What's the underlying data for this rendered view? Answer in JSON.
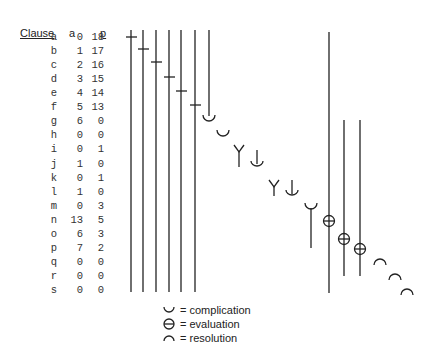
{
  "table": {
    "headers": {
      "clause": "Clause",
      "a": "a",
      "p": "p"
    },
    "rows": [
      {
        "clause": "a",
        "a": "0",
        "p": "18"
      },
      {
        "clause": "b",
        "a": "1",
        "p": "17"
      },
      {
        "clause": "c",
        "a": "2",
        "p": "16"
      },
      {
        "clause": "d",
        "a": "3",
        "p": "15"
      },
      {
        "clause": "e",
        "a": "4",
        "p": "14"
      },
      {
        "clause": "f",
        "a": "5",
        "p": "13"
      },
      {
        "clause": "g",
        "a": "6",
        "p": "0"
      },
      {
        "clause": "h",
        "a": "0",
        "p": "0"
      },
      {
        "clause": "i",
        "a": "0",
        "p": "1"
      },
      {
        "clause": "j",
        "a": "1",
        "p": "0"
      },
      {
        "clause": "k",
        "a": "0",
        "p": "1"
      },
      {
        "clause": "l",
        "a": "1",
        "p": "0"
      },
      {
        "clause": "m",
        "a": "0",
        "p": "3"
      },
      {
        "clause": "n",
        "a": "13",
        "p": "5"
      },
      {
        "clause": "o",
        "a": "6",
        "p": "3"
      },
      {
        "clause": "p",
        "a": "7",
        "p": "2"
      },
      {
        "clause": "q",
        "a": "0",
        "p": "0"
      },
      {
        "clause": "r",
        "a": "0",
        "p": "0"
      },
      {
        "clause": "s",
        "a": "0",
        "p": "0"
      }
    ]
  },
  "legend": [
    {
      "symbol": "complication-icon",
      "label": "= complication"
    },
    {
      "symbol": "evaluation-icon",
      "label": "= evaluation"
    },
    {
      "symbol": "resolution-icon",
      "label": "= resolution"
    }
  ],
  "colors": {
    "ink": "#222222",
    "background": "#ffffff"
  }
}
